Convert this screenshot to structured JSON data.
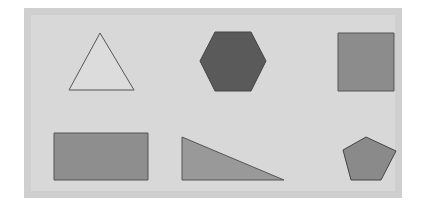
{
  "canvas": {
    "background": "#ffffff",
    "panel_outer_color": "#cfcfcf",
    "panel_inner_color": "#d8d8d8"
  },
  "shapes": [
    {
      "type": "triangle",
      "fill": "#dcdcdc",
      "stroke": "#555555",
      "points": "100,33 134,90 69,90"
    },
    {
      "type": "hexagon",
      "fill": "#5a5a5a",
      "stroke": "#444444",
      "points": "215,32 251,32 266,61 251,91 215,91 200,61"
    },
    {
      "type": "square",
      "fill": "#8c8c8c",
      "stroke": "#555555",
      "points": "338,33 394,33 394,91 338,91"
    },
    {
      "type": "rectangle",
      "fill": "#8e8e8e",
      "stroke": "#555555",
      "points": "54,133 148,133 148,180 54,180"
    },
    {
      "type": "right-triangle",
      "fill": "#999999",
      "stroke": "#555555",
      "points": "182,137 284,180 182,180"
    },
    {
      "type": "pentagon",
      "fill": "#8a8a8a",
      "stroke": "#444444",
      "points": "366,137 396,151 381,180 351,180 343,150"
    }
  ]
}
